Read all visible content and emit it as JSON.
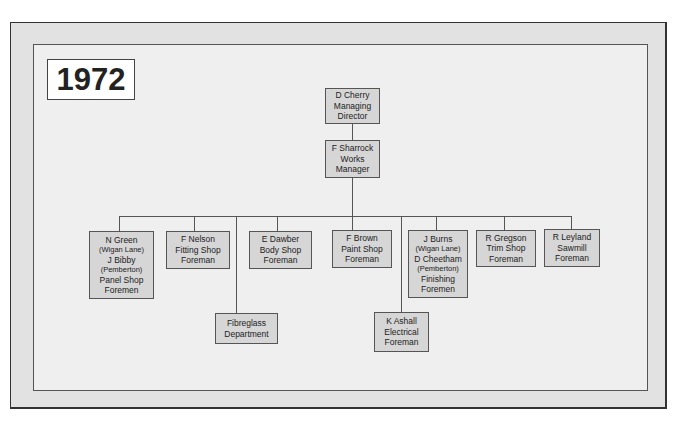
{
  "chart": {
    "year": "1972",
    "nodes": {
      "md": {
        "lines": [
          "D Cherry",
          "Managing",
          "Director"
        ]
      },
      "wm": {
        "lines": [
          "F Sharrock",
          "Works",
          "Manager"
        ]
      },
      "panel": {
        "lines": [
          "N Green",
          "(Wigan Lane)",
          "J Bibby",
          "(Pemberton)",
          "Panel Shop",
          "Foremen"
        ]
      },
      "fitting": {
        "lines": [
          "F Nelson",
          "Fitting Shop",
          "Foreman"
        ]
      },
      "fibreglass": {
        "lines": [
          "Fibreglass",
          "Department"
        ]
      },
      "body": {
        "lines": [
          "E Dawber",
          "Body Shop",
          "Foreman"
        ]
      },
      "paint": {
        "lines": [
          "F Brown",
          "Paint Shop",
          "Foreman"
        ]
      },
      "electrical": {
        "lines": [
          "K Ashall",
          "Electrical",
          "Foreman"
        ]
      },
      "finishing": {
        "lines": [
          "J Burns",
          "(Wigan Lane)",
          "D Cheetham",
          "(Pemberton)",
          "Finishing",
          "Foremen"
        ]
      },
      "trim": {
        "lines": [
          "R Gregson",
          "Trim Shop",
          "Foreman"
        ]
      },
      "sawmill": {
        "lines": [
          "R Leyland",
          "Sawmill",
          "Foreman"
        ]
      }
    },
    "colors": {
      "node_fill": "#d6d6d6",
      "frame_outer": "#e2e2e2",
      "frame_inner": "#efefef",
      "line": "#555555"
    }
  }
}
